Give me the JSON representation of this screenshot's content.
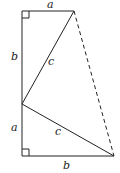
{
  "diagram": {
    "type": "geometry-figure",
    "labels": {
      "top_a": "a",
      "upper_left_b": "b",
      "upper_c": "c",
      "lower_left_a": "a",
      "lower_c": "c",
      "bottom_b": "b"
    },
    "colors": {
      "line": "#222222",
      "background": "#ffffff"
    }
  }
}
